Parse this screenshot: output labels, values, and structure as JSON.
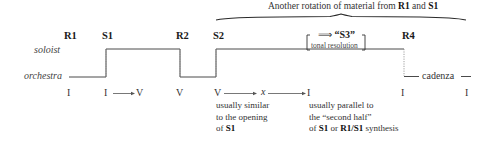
{
  "brace_label": {
    "prefix": "Another rotation of material from ",
    "r1": "R1",
    "and": " and ",
    "s1": "S1"
  },
  "sections": [
    {
      "id": "r1",
      "label": "R1"
    },
    {
      "id": "s1",
      "label": "S1"
    },
    {
      "id": "r2",
      "label": "R2"
    },
    {
      "id": "s2",
      "label": "S2"
    },
    {
      "id": "r4",
      "label": "R4"
    }
  ],
  "s3_box": {
    "arrow": "⟹",
    "label": "“S3”",
    "sublabel": "tonal resolution"
  },
  "roles": {
    "soloist": "soloist",
    "orchestra": "orchestra"
  },
  "cadenza": "cadenza",
  "keys": {
    "r1": "I",
    "s1_start": "I",
    "s1_end": "V",
    "r2": "V",
    "s2_start": "V",
    "s2_mid": "x",
    "s2_end": "I",
    "r4": "I",
    "final": "I"
  },
  "notes": {
    "s2": {
      "line1": "usually similar",
      "line2": "to the opening",
      "line3_prefix": "of ",
      "line3_bold": "S1"
    },
    "s3": {
      "line1": "usually parallel to",
      "line2": "the “second half”",
      "line3_prefix": "of ",
      "line3_bold1": "S1",
      "line3_mid": " or ",
      "line3_bold2": "R1/S1",
      "line3_suffix": " synthesis"
    }
  },
  "colors": {
    "line": "#4a4a4a",
    "dotted": "#777777",
    "text": "#222222"
  }
}
